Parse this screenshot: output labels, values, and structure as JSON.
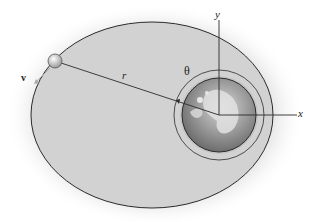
{
  "diagram": {
    "labels": {
      "velocity": "v",
      "radius": "r",
      "angle": "θ",
      "y_axis": "y",
      "x_axis": "x"
    },
    "colors": {
      "orbit_fill": "#d4d4d4",
      "orbit_stroke": "#2b2b2b",
      "earth_fill": "#8a8a8a",
      "halo": "#c8c8c8",
      "background": "#ffffff"
    },
    "geometry": {
      "earth_center": [
        219,
        115
      ],
      "earth_radius": 37,
      "theta_arc_radius": 45,
      "orbit_ellipse": {
        "cx": 152,
        "cy": 115,
        "rx": 121,
        "ry": 93
      },
      "satellite": [
        55,
        61
      ]
    }
  }
}
